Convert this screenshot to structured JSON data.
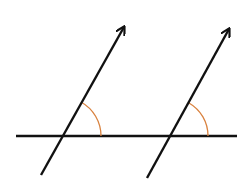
{
  "diagram": {
    "title": "",
    "colors": {
      "background": "#ffffff",
      "line": "#111111",
      "angle_arc": "#d9823f"
    },
    "horizontal_line": {
      "x1": 16,
      "y1": 136,
      "x2": 237,
      "y2": 136
    },
    "arrows": [
      {
        "id": "left",
        "x1": 41,
        "y1": 175,
        "x2": 124,
        "y2": 27
      },
      {
        "id": "right",
        "x1": 147,
        "y1": 178,
        "x2": 229,
        "y2": 29
      }
    ],
    "angle_arcs": [
      {
        "id": "left-angle",
        "cx": 62,
        "cy": 136,
        "r": 39,
        "start": [
          101,
          136
        ],
        "end": [
          81,
          102
        ]
      },
      {
        "id": "right-angle",
        "cx": 170,
        "cy": 136,
        "r": 38,
        "start": [
          208,
          136
        ],
        "end": [
          189,
          103
        ]
      }
    ]
  }
}
